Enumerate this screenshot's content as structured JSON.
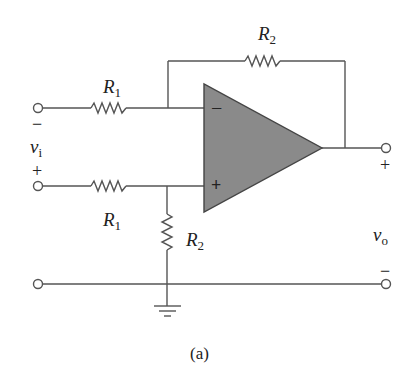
{
  "figure": {
    "caption": "(a)",
    "type": "op-amp difference amplifier schematic"
  },
  "components": {
    "r1_top": {
      "name": "R",
      "sub": "1"
    },
    "r1_bottom": {
      "name": "R",
      "sub": "1"
    },
    "r2_feedback": {
      "name": "R",
      "sub": "2"
    },
    "r2_ground": {
      "name": "R",
      "sub": "2"
    },
    "opamp": {
      "inverting": "−",
      "noninverting": "+"
    }
  },
  "terminals": {
    "input": {
      "name": "v",
      "sub": "i",
      "top_sign": "−",
      "bottom_sign": "+"
    },
    "output": {
      "name": "v",
      "sub": "o",
      "top_sign": "+",
      "bottom_sign": "−"
    }
  },
  "colors": {
    "wire": "#555555",
    "opamp_fill": "#8a8a8a",
    "text": "#222222"
  }
}
